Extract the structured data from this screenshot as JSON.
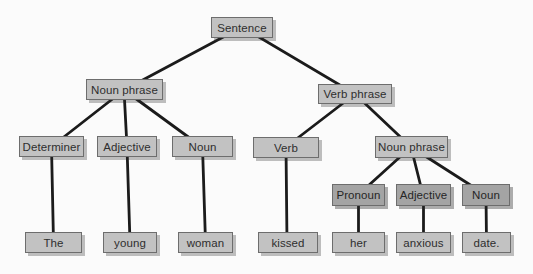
{
  "diagram": {
    "type": "syntax-tree",
    "colors": {
      "background": "#fbfbfb",
      "box_fill_light": "#c2c2c2",
      "box_fill_dark": "#a4a4a4",
      "box_border": "#6d6d6d",
      "connector_line": "#1b1b1b",
      "label_text": "#2e2e2e"
    },
    "nodes": {
      "sentence": {
        "label": "Sentence"
      },
      "noun_phrase_1": {
        "label": "Noun phrase"
      },
      "verb_phrase": {
        "label": "Verb phrase"
      },
      "determiner": {
        "label": "Determiner"
      },
      "adjective_1": {
        "label": "Adjective"
      },
      "noun_1": {
        "label": "Noun"
      },
      "verb": {
        "label": "Verb"
      },
      "noun_phrase_2": {
        "label": "Noun phrase"
      },
      "pronoun": {
        "label": "Pronoun"
      },
      "adjective_2": {
        "label": "Adjective"
      },
      "noun_2": {
        "label": "Noun"
      },
      "word_the": {
        "label": "The"
      },
      "word_young": {
        "label": "young"
      },
      "word_woman": {
        "label": "woman"
      },
      "word_kissed": {
        "label": "kissed"
      },
      "word_her": {
        "label": "her"
      },
      "word_anxious": {
        "label": "anxious"
      },
      "word_date": {
        "label": "date."
      }
    }
  }
}
